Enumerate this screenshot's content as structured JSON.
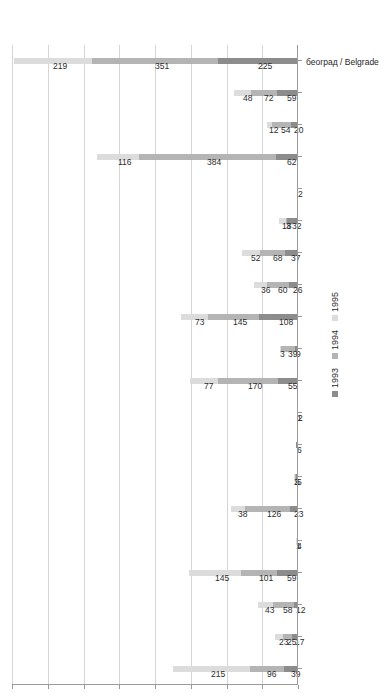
{
  "chart_data": {
    "type": "bar",
    "orientation": "vertical-rendered-rotated",
    "stacked": true,
    "title": "",
    "subtitle": "",
    "xlabel": "",
    "ylabel": "",
    "ylim": [
      0,
      800
    ],
    "ytick_step": 100,
    "grid": true,
    "legend_position": "bottom-right",
    "categories": [
      "шверц / šverc (smuggle/smuggling)",
      "црно тржиште / black market",
      "цигаре / cigarettes",
      "цене / price/s",
      "фри шоп / duty free shop",
      "турска / Turkey",
      "терористи / terrorist/s",
      "сиво тржиште / grey market",
      "потрошачка корпа / consumer basket",
      "оружје / weapons",
      "Нови Пазар  Novi Pazar",
      "Муслиман / Muslim/s",
      "лоше / a / bad",
      "лепо / a / nice",
      "ислам / Islam",
      "екстремиста / extremist",
      "добро/а / good",
      "девизе / currency / foreign exchange",
      "границе/а / border/s",
      "београд / Belgrade"
    ],
    "series": [
      {
        "name": "1993",
        "color": "#8c8c8c",
        "values": [
          39,
          17,
          12,
          59,
          4,
          23,
          5,
          6,
          2,
          55,
          9,
          108,
          26,
          37,
          32,
          2,
          62,
          20,
          59,
          225
        ]
      },
      {
        "name": "1994",
        "color": "#b4b4b4",
        "values": [
          96,
          25,
          58,
          101,
          0,
          126,
          5,
          0,
          0,
          170,
          39,
          145,
          60,
          68,
          3,
          0,
          384,
          54,
          72,
          351
        ]
      },
      {
        "name": "1995",
        "color": "#dcdcdc",
        "values": [
          215,
          23,
          43,
          145,
          1,
          38,
          2,
          0,
          1,
          77,
          3,
          73,
          36,
          52,
          18,
          0,
          116,
          12,
          48,
          219
        ]
      }
    ],
    "ytick_labels": [
      "0",
      "100",
      "200",
      "300",
      "400",
      "500",
      "600",
      "700",
      "800"
    ],
    "legend_entries": [
      "1993",
      "1994",
      "1995"
    ]
  }
}
